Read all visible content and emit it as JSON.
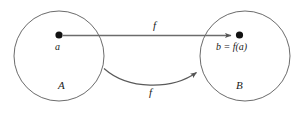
{
  "figure": {
    "background_color": "#ffffff",
    "stroke_color": "#555555",
    "text_color": "#1a1a1a",
    "sets": {
      "domain": {
        "label": "A",
        "center_x": 59,
        "center_y": 56,
        "radius": 45
      },
      "codomain": {
        "label": "B",
        "center_x": 245,
        "center_y": 56,
        "radius": 45
      }
    },
    "points": {
      "domain_point": {
        "label": "a",
        "x": 59,
        "y": 35
      },
      "codomain_point": {
        "label": "b = f(a)",
        "x": 240,
        "y": 35
      }
    },
    "arrows": {
      "straight": {
        "label": "f",
        "from_x": 63,
        "from_y": 35,
        "to_x": 233,
        "to_y": 35
      },
      "curved": {
        "label": "f",
        "from_x": 104,
        "from_y": 69,
        "to_x": 197,
        "to_y": 71
      }
    }
  }
}
